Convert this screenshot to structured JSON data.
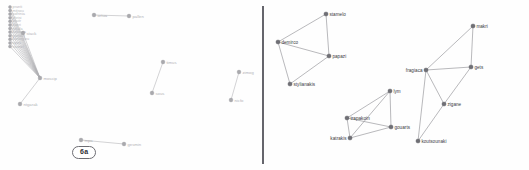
{
  "figure": {
    "background_color": "#fefefe",
    "divider_color": "#4a4a52",
    "node_color": "#6f6f75",
    "edge_color": "#8a8a8e",
    "faint_color": "#b2b2b6"
  },
  "panel_a": {
    "tag": "6a",
    "stacked_labels": [
      "pranti",
      "mitsou",
      "sofrinia",
      "chrisi",
      "koutr",
      "kopri",
      "nikola",
      "kostaria",
      "gianiop",
      "kontoglou",
      "apos",
      "stamel"
    ],
    "nodes": [
      {
        "id": "a1",
        "label": "ortua",
        "x": 94,
        "y": 15
      },
      {
        "id": "a2",
        "label": "pallen",
        "x": 129,
        "y": 16
      },
      {
        "id": "a3",
        "label": "moscip",
        "x": 40,
        "y": 78
      },
      {
        "id": "a4",
        "label": "ntgarak",
        "x": 20,
        "y": 104
      },
      {
        "id": "a5",
        "label": "stack",
        "x": 23,
        "y": 33
      },
      {
        "id": "a6",
        "label": "timus",
        "x": 163,
        "y": 62
      },
      {
        "id": "a7",
        "label": "sous",
        "x": 152,
        "y": 93
      },
      {
        "id": "a8",
        "label": "zimog",
        "x": 239,
        "y": 72
      },
      {
        "id": "a9",
        "label": "nicfo",
        "x": 231,
        "y": 100
      },
      {
        "id": "a10",
        "label": "mpa",
        "x": 81,
        "y": 140
      },
      {
        "id": "a11",
        "label": "gesmin",
        "x": 124,
        "y": 144
      }
    ],
    "edges": [
      {
        "from": "a1",
        "to": "a2"
      },
      {
        "from": "a3",
        "to": "a4"
      },
      {
        "from": "a3",
        "to": "a5"
      },
      {
        "from": "a6",
        "to": "a7"
      },
      {
        "from": "a8",
        "to": "a9"
      },
      {
        "from": "a10",
        "to": "a11"
      }
    ]
  },
  "panel_b": {
    "tag": "6b",
    "nodes": [
      {
        "id": "b1",
        "label": "stamelo",
        "x": 60,
        "y": 14,
        "anchor": "start"
      },
      {
        "id": "b2",
        "label": "demirco",
        "x": 12,
        "y": 42,
        "anchor": "start"
      },
      {
        "id": "b3",
        "label": "papazi",
        "x": 63,
        "y": 56,
        "anchor": "start"
      },
      {
        "id": "b4",
        "label": "stylianakis",
        "x": 24,
        "y": 84,
        "anchor": "start"
      },
      {
        "id": "b5",
        "label": "lym",
        "x": 124,
        "y": 91,
        "anchor": "start"
      },
      {
        "id": "b6",
        "label": "trapakoin",
        "x": 81,
        "y": 118,
        "anchor": "start"
      },
      {
        "id": "b7",
        "label": "gouarts",
        "x": 125,
        "y": 127,
        "anchor": "start"
      },
      {
        "id": "b8",
        "label": "katrakis",
        "x": 84,
        "y": 138,
        "anchor": "end"
      },
      {
        "id": "b9",
        "label": "makri",
        "x": 207,
        "y": 26,
        "anchor": "start"
      },
      {
        "id": "b10",
        "label": "gets",
        "x": 205,
        "y": 67,
        "anchor": "start"
      },
      {
        "id": "b11",
        "label": "fragiaca",
        "x": 160,
        "y": 70,
        "anchor": "end"
      },
      {
        "id": "b12",
        "label": "zigane",
        "x": 178,
        "y": 104,
        "anchor": "start"
      },
      {
        "id": "b13",
        "label": "koutsounaki",
        "x": 152,
        "y": 141,
        "anchor": "start"
      }
    ],
    "edges": [
      {
        "from": "b1",
        "to": "b2"
      },
      {
        "from": "b1",
        "to": "b3"
      },
      {
        "from": "b2",
        "to": "b3"
      },
      {
        "from": "b2",
        "to": "b4"
      },
      {
        "from": "b3",
        "to": "b4"
      },
      {
        "from": "b5",
        "to": "b6"
      },
      {
        "from": "b5",
        "to": "b7"
      },
      {
        "from": "b5",
        "to": "b8"
      },
      {
        "from": "b6",
        "to": "b7"
      },
      {
        "from": "b6",
        "to": "b8"
      },
      {
        "from": "b7",
        "to": "b8"
      },
      {
        "from": "b9",
        "to": "b10"
      },
      {
        "from": "b9",
        "to": "b11"
      },
      {
        "from": "b10",
        "to": "b11"
      },
      {
        "from": "b10",
        "to": "b12"
      },
      {
        "from": "b11",
        "to": "b12"
      },
      {
        "from": "b11",
        "to": "b13"
      },
      {
        "from": "b12",
        "to": "b13"
      }
    ]
  }
}
